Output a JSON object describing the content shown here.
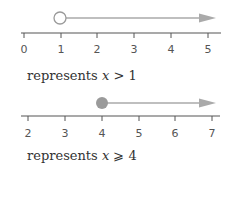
{
  "diagrams": [
    {
      "ticks": [
        "0",
        "1",
        "2",
        "3",
        "4",
        "5"
      ],
      "point_value": "1",
      "point_style": "open",
      "direction": "right",
      "caption": {
        "prefix": "represents",
        "variable": "x",
        "operator": ">",
        "value": "1"
      }
    },
    {
      "ticks": [
        "2",
        "3",
        "4",
        "5",
        "6",
        "7"
      ],
      "point_value": "4",
      "point_style": "closed",
      "direction": "right",
      "caption": {
        "prefix": "represents",
        "variable": "x",
        "operator": "⩾",
        "value": "4"
      }
    }
  ],
  "colors": {
    "axis": "#555555",
    "ray": "#aaaaaa",
    "filled_point": "#9a9a9a",
    "open_point_stroke": "#9a9a9a"
  }
}
